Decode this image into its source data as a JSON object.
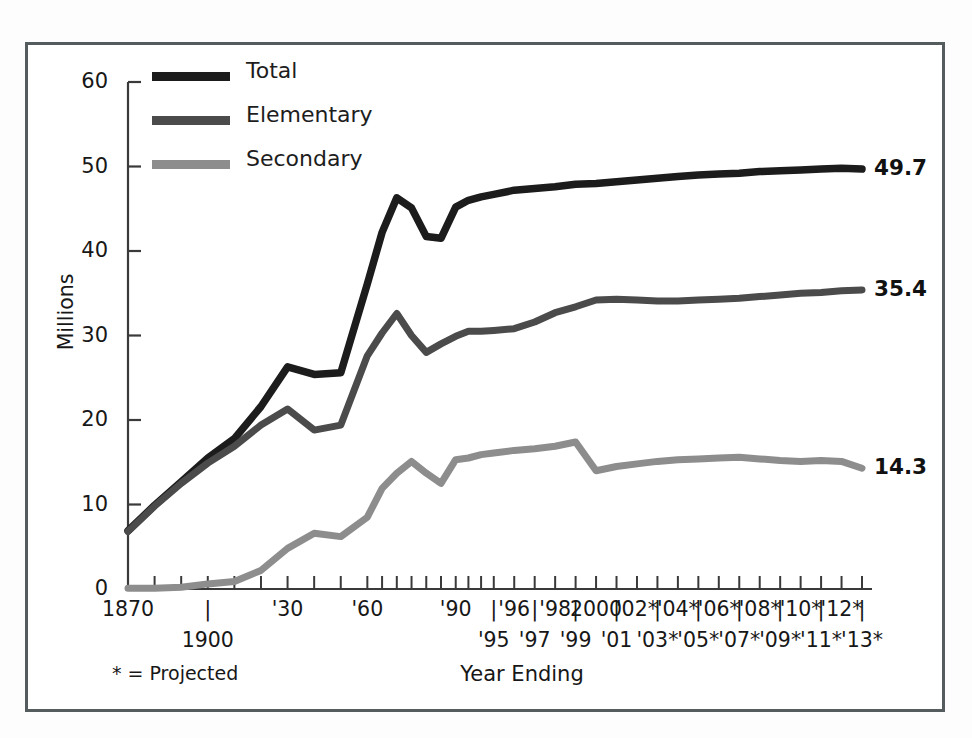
{
  "figure": {
    "ylabel": "Millions",
    "xlabel": "Year Ending",
    "footnote": "* = Projected"
  },
  "legend": {
    "items": [
      {
        "label": "Total",
        "color": "#1c1c1c"
      },
      {
        "label": "Elementary",
        "color": "#4b4b4b"
      },
      {
        "label": "Secondary",
        "color": "#8d8d8d"
      }
    ]
  },
  "end_labels": [
    {
      "name": "total-end-label",
      "value": "49.7"
    },
    {
      "name": "elementary-end-label",
      "value": "35.4"
    },
    {
      "name": "secondary-end-label",
      "value": "14.3"
    }
  ],
  "y_axis": {
    "ticks": [
      "0",
      "10",
      "20",
      "30",
      "40",
      "50",
      "60"
    ],
    "min": 0,
    "max": 60
  },
  "x_axis": {
    "upper_row": [
      "1870",
      "'30",
      "'60",
      "'90",
      "'96",
      "'98",
      "2000",
      "'02*",
      "'04*",
      "'06*",
      "'08*",
      "'10*",
      "'12*"
    ],
    "lower_row": [
      "1900",
      "'95",
      "'97",
      "'99",
      "'01",
      "'03*",
      "'05*",
      "'07*",
      "'09*",
      "'11*",
      "'13*"
    ],
    "separator": "|"
  },
  "chart_data": {
    "type": "line",
    "title": "",
    "xlabel": "Year Ending",
    "ylabel": "Millions",
    "ylim": [
      0,
      60
    ],
    "grid": false,
    "legend_position": "top-left",
    "annotations": [
      "* = Projected"
    ],
    "x": [
      "1870",
      "1880",
      "1890",
      "1900",
      "1910",
      "1920",
      "1930",
      "1940",
      "1950",
      "1960",
      "1965",
      "1970",
      "1975",
      "1980",
      "1985",
      "1990",
      "1992",
      "1994",
      "1995",
      "1996",
      "1997",
      "1998",
      "1999",
      "2000",
      "2001",
      "2002",
      "2003",
      "2004",
      "2005",
      "2006",
      "2007",
      "2008",
      "2009",
      "2010",
      "2011",
      "2012",
      "2013"
    ],
    "series": [
      {
        "name": "Total",
        "color": "#1c1c1c",
        "values": [
          6.9,
          9.9,
          12.7,
          15.5,
          17.8,
          21.6,
          26.3,
          25.4,
          25.6,
          36.1,
          42.2,
          46.3,
          45.1,
          41.7,
          41.5,
          45.2,
          46.0,
          46.4,
          46.7,
          47.2,
          47.4,
          47.6,
          47.9,
          48.0,
          48.2,
          48.4,
          48.6,
          48.8,
          49.0,
          49.1,
          49.2,
          49.4,
          49.5,
          49.6,
          49.7,
          49.8,
          49.7
        ]
      },
      {
        "name": "Elementary",
        "color": "#4b4b4b",
        "values": [
          6.8,
          9.8,
          12.5,
          14.9,
          16.9,
          19.4,
          21.3,
          18.8,
          19.4,
          27.6,
          30.3,
          32.6,
          30.0,
          28.0,
          29.0,
          29.9,
          30.5,
          30.5,
          30.6,
          30.8,
          31.6,
          32.7,
          33.4,
          34.2,
          34.3,
          34.2,
          34.1,
          34.1,
          34.2,
          34.3,
          34.4,
          34.6,
          34.8,
          35.0,
          35.1,
          35.3,
          35.4
        ]
      },
      {
        "name": "Secondary",
        "color": "#8d8d8d",
        "values": [
          0.1,
          0.1,
          0.2,
          0.6,
          0.9,
          2.2,
          4.8,
          6.6,
          6.2,
          8.5,
          11.9,
          13.7,
          15.1,
          13.7,
          12.5,
          15.3,
          15.5,
          15.9,
          16.1,
          16.4,
          16.6,
          16.9,
          17.4,
          14.0,
          14.5,
          14.8,
          15.1,
          15.3,
          15.4,
          15.5,
          15.6,
          15.4,
          15.2,
          15.1,
          15.2,
          15.1,
          14.3
        ]
      }
    ]
  }
}
